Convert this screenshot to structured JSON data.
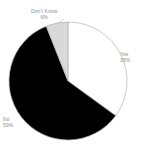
{
  "chart_data": {
    "type": "pie",
    "title": "",
    "categories": [
      "Yes",
      "No",
      "Don't Know"
    ],
    "values": [
      35,
      59,
      6
    ],
    "value_suffix": "%",
    "slice_colors": [
      "#ffffff",
      "#000000",
      "#d9d9d9"
    ],
    "slice_border_color": "#b3b3b3",
    "background": "#ffffff",
    "label_color": "#8c8c8c",
    "legend": "none",
    "labels_position": "outside",
    "start_angle_deg": 0,
    "direction": "clockwise",
    "slices": [
      {
        "name": "Yes",
        "label": "Yes",
        "value": 35,
        "value_text": "35%",
        "color": "#ffffff"
      },
      {
        "name": "No",
        "label": "No",
        "value": 59,
        "value_text": "59%",
        "color": "#000000"
      },
      {
        "name": "Don't Know",
        "label": "Don't Know",
        "value": 6,
        "value_text": "6%",
        "color": "#d9d9d9"
      }
    ]
  },
  "geometry": {
    "center_x": 68,
    "center_y": 81,
    "radius": 59
  }
}
